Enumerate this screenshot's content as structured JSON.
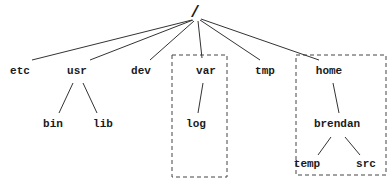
{
  "diagram": {
    "type": "directory-tree",
    "root": {
      "label": "/",
      "x": 195,
      "y": 17
    },
    "nodes": {
      "etc": {
        "label": "etc",
        "x": 20,
        "y": 74
      },
      "usr": {
        "label": "usr",
        "x": 77,
        "y": 74
      },
      "dev": {
        "label": "dev",
        "x": 141,
        "y": 74
      },
      "var": {
        "label": "var",
        "x": 206,
        "y": 74
      },
      "tmp": {
        "label": "tmp",
        "x": 265,
        "y": 74
      },
      "home": {
        "label": "home",
        "x": 329,
        "y": 74
      },
      "bin": {
        "label": "bin",
        "x": 53,
        "y": 127
      },
      "lib": {
        "label": "lib",
        "x": 103,
        "y": 127
      },
      "log": {
        "label": "log",
        "x": 196,
        "y": 127
      },
      "brendan": {
        "label": "brendan",
        "x": 337,
        "y": 127
      },
      "temp": {
        "label": "temp",
        "x": 307,
        "y": 167
      },
      "src": {
        "label": "src",
        "x": 366,
        "y": 167
      }
    },
    "edges": [
      {
        "from": "/",
        "to": "etc",
        "x1": 192,
        "y1": 20,
        "x2": 32,
        "y2": 60
      },
      {
        "from": "/",
        "to": "usr",
        "x1": 193,
        "y1": 20,
        "x2": 90,
        "y2": 60
      },
      {
        "from": "/",
        "to": "dev",
        "x1": 194,
        "y1": 21,
        "x2": 150,
        "y2": 60
      },
      {
        "from": "/",
        "to": "var",
        "x1": 198,
        "y1": 21,
        "x2": 202,
        "y2": 58
      },
      {
        "from": "/",
        "to": "tmp",
        "x1": 200,
        "y1": 20,
        "x2": 260,
        "y2": 60
      },
      {
        "from": "/",
        "to": "home",
        "x1": 201,
        "y1": 19,
        "x2": 319,
        "y2": 60
      },
      {
        "from": "usr",
        "to": "bin",
        "x1": 73,
        "y1": 83,
        "x2": 59,
        "y2": 113
      },
      {
        "from": "usr",
        "to": "lib",
        "x1": 83,
        "y1": 83,
        "x2": 97,
        "y2": 113
      },
      {
        "from": "var",
        "to": "log",
        "x1": 203,
        "y1": 83,
        "x2": 198,
        "y2": 113
      },
      {
        "from": "home",
        "to": "brendan",
        "x1": 333,
        "y1": 83,
        "x2": 339,
        "y2": 113
      },
      {
        "from": "brendan",
        "to": "temp",
        "x1": 331,
        "y1": 137,
        "x2": 318,
        "y2": 155
      },
      {
        "from": "brendan",
        "to": "src",
        "x1": 345,
        "y1": 137,
        "x2": 360,
        "y2": 155
      }
    ],
    "groups": [
      {
        "name": "var-subtree",
        "x": 172,
        "y": 55,
        "width": 55,
        "height": 122
      },
      {
        "name": "home-subtree",
        "x": 296,
        "y": 55,
        "width": 90,
        "height": 120
      }
    ]
  }
}
